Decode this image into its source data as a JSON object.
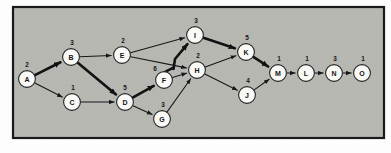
{
  "diagram": {
    "frame": {
      "x": 13,
      "y": 7,
      "width": 371,
      "height": 131,
      "fill": "#b9b9b4",
      "stroke": "#1a1a1a"
    },
    "node_radius": 8.4,
    "colors": {
      "background": "#b9b9b4",
      "node_fill": "#fbfbf8",
      "node_stroke": "#262628",
      "edge": "#17171a",
      "critical_path_edge": "#121214",
      "text": "#141416"
    },
    "nodes": [
      {
        "id": "A",
        "label": "A",
        "duration": "2",
        "x": 27,
        "y": 79,
        "dx": -3,
        "dy": -12
      },
      {
        "id": "B",
        "label": "B",
        "duration": "3",
        "x": 71,
        "y": 57,
        "dx": -2,
        "dy": -12
      },
      {
        "id": "C",
        "label": "C",
        "duration": "1",
        "x": 72,
        "y": 102,
        "dx": -2,
        "dy": -12
      },
      {
        "id": "D",
        "label": "D",
        "duration": "5",
        "x": 125,
        "y": 102,
        "dx": -3,
        "dy": -12
      },
      {
        "id": "E",
        "label": "E",
        "duration": "2",
        "x": 122,
        "y": 55,
        "dx": -2,
        "dy": -12
      },
      {
        "id": "F",
        "label": "F",
        "duration": "6",
        "x": 164,
        "y": 80,
        "dx": -12,
        "dy": -9
      },
      {
        "id": "G",
        "label": "G",
        "duration": "3",
        "x": 162,
        "y": 119,
        "dx": -2,
        "dy": -12
      },
      {
        "id": "H",
        "label": "H",
        "duration": "2",
        "x": 197,
        "y": 70,
        "dx": -2,
        "dy": -12
      },
      {
        "id": "I",
        "label": "I",
        "duration": "3",
        "x": 195,
        "y": 35,
        "dx": -2,
        "dy": -12
      },
      {
        "id": "J",
        "label": "J",
        "duration": "4",
        "x": 247,
        "y": 95,
        "dx": -2,
        "dy": -12
      },
      {
        "id": "K",
        "label": "K",
        "duration": "5",
        "x": 246,
        "y": 52,
        "dx": -2,
        "dy": -12
      },
      {
        "id": "L",
        "label": "L",
        "duration": "1",
        "x": 306,
        "y": 73,
        "dx": -2,
        "dy": -12
      },
      {
        "id": "M",
        "label": "M",
        "duration": "1",
        "x": 278,
        "y": 73,
        "dx": -2,
        "dy": -12
      },
      {
        "id": "N",
        "label": "N",
        "duration": "3",
        "x": 334,
        "y": 73,
        "dx": -2,
        "dy": -12
      },
      {
        "id": "O",
        "label": "O",
        "duration": "1",
        "x": 362,
        "y": 73,
        "dx": -2,
        "dy": -12
      }
    ],
    "edges": [
      {
        "from": "A",
        "to": "B",
        "critical": true
      },
      {
        "from": "A",
        "to": "C",
        "critical": false
      },
      {
        "from": "B",
        "to": "E",
        "critical": false
      },
      {
        "from": "B",
        "to": "D",
        "critical": true
      },
      {
        "from": "C",
        "to": "D",
        "critical": false
      },
      {
        "from": "D",
        "to": "F",
        "critical": true
      },
      {
        "from": "D",
        "to": "G",
        "critical": false
      },
      {
        "from": "E",
        "to": "I",
        "critical": false
      },
      {
        "from": "E",
        "to": "H",
        "critical": false
      },
      {
        "from": "F",
        "to": "I",
        "critical": true,
        "elbow": true
      },
      {
        "from": "F",
        "to": "H",
        "critical": false
      },
      {
        "from": "G",
        "to": "H",
        "critical": false
      },
      {
        "from": "H",
        "to": "K",
        "critical": false
      },
      {
        "from": "H",
        "to": "J",
        "critical": false
      },
      {
        "from": "I",
        "to": "K",
        "critical": true
      },
      {
        "from": "J",
        "to": "M",
        "critical": false
      },
      {
        "from": "K",
        "to": "M",
        "critical": true
      },
      {
        "from": "M",
        "to": "L",
        "critical": false
      },
      {
        "from": "L",
        "to": "N",
        "critical": false
      },
      {
        "from": "N",
        "to": "O",
        "critical": false
      }
    ],
    "critical_path": [
      "A",
      "B",
      "D",
      "F",
      "I",
      "K",
      "M"
    ]
  }
}
